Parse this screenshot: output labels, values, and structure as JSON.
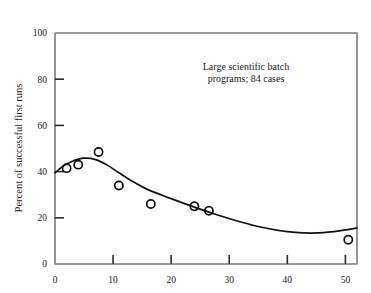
{
  "chart_data": {
    "type": "scatter",
    "title": "",
    "xlabel": "",
    "ylabel": "Percent of successful first runs",
    "xlim": [
      0,
      52
    ],
    "ylim": [
      0,
      100
    ],
    "grid": false,
    "legend": "none",
    "annotations": [
      {
        "name": "sample-description",
        "line1": "Large scientific batch",
        "line2": "programs; 84 cases",
        "x": 26,
        "y": 78
      }
    ],
    "x_ticks": [
      0,
      10,
      20,
      30,
      40,
      50
    ],
    "x_tick_labels": [
      "0",
      "10",
      "20",
      "30",
      "40",
      "50"
    ],
    "y_ticks": [
      0,
      20,
      40,
      60,
      80,
      100
    ],
    "y_tick_labels": [
      "0",
      "20",
      "40",
      "60",
      "80",
      "100"
    ],
    "series": [
      {
        "name": "observed-points",
        "marker": "open-circle",
        "color": "#0d0d0d",
        "x": [
          2.0,
          4.0,
          7.5,
          11.0,
          16.5,
          24.0,
          26.5,
          50.5
        ],
        "y": [
          41.5,
          43.0,
          48.5,
          34.0,
          26.0,
          25.0,
          23.0,
          10.5
        ]
      },
      {
        "name": "fitted-curve",
        "marker": "none",
        "color": "#111111",
        "x": [
          0.0,
          1.5,
          3.0,
          5.0,
          7.0,
          9.0,
          11.0,
          13.0,
          16.0,
          20.0,
          24.0,
          28.0,
          32.0,
          36.0,
          40.0,
          44.0,
          47.0,
          50.0,
          52.0
        ],
        "y": [
          39.5,
          42.5,
          44.5,
          45.8,
          45.2,
          42.8,
          39.5,
          36.3,
          32.2,
          28.3,
          24.6,
          21.2,
          18.2,
          15.7,
          14.0,
          13.4,
          13.8,
          14.8,
          15.6
        ]
      }
    ]
  },
  "labels": {
    "y_axis_title": "Percent of successful first runs"
  }
}
